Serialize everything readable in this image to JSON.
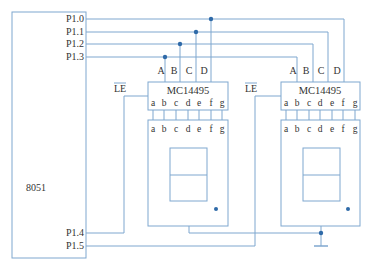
{
  "diagram": {
    "type": "circuit-schematic",
    "colors": {
      "wire": "#7fa7cf",
      "junction": "#2f6aa8",
      "text": "#333333"
    },
    "mcu": {
      "label": "8051",
      "ports": [
        "P1.0",
        "P1.1",
        "P1.2",
        "P1.3",
        "P1.4",
        "P1.5"
      ]
    },
    "decoders": [
      {
        "label": "MC14495",
        "inputs": [
          "A",
          "B",
          "C",
          "D"
        ],
        "enable": "LE",
        "outputs": [
          "a",
          "b",
          "c",
          "d",
          "e",
          "f",
          "g"
        ]
      },
      {
        "label": "MC14495",
        "inputs": [
          "A",
          "B",
          "C",
          "D"
        ],
        "enable": "LE",
        "outputs": [
          "a",
          "b",
          "c",
          "d",
          "e",
          "f",
          "g"
        ]
      }
    ],
    "displays": [
      {
        "segments": [
          "a",
          "b",
          "c",
          "d",
          "e",
          "f",
          "g"
        ]
      },
      {
        "segments": [
          "a",
          "b",
          "c",
          "d",
          "e",
          "f",
          "g"
        ]
      }
    ],
    "connections": [
      {
        "from": "P1.0",
        "to": "D (both decoders)"
      },
      {
        "from": "P1.1",
        "to": "C (both decoders)"
      },
      {
        "from": "P1.2",
        "to": "B (both decoders)"
      },
      {
        "from": "P1.3",
        "to": "A (both decoders)"
      },
      {
        "from": "P1.4",
        "to": "LE (left decoder)"
      },
      {
        "from": "P1.5",
        "to": "LE (right decoder)"
      },
      {
        "from": "display commons",
        "to": "ground"
      }
    ]
  }
}
